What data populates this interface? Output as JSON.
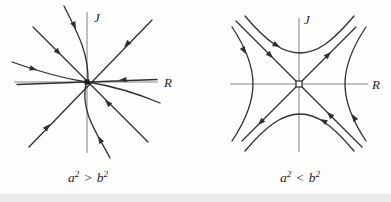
{
  "figure": {
    "panels": [
      {
        "id": "left",
        "axis_labels": {
          "horizontal": "R",
          "vertical": "J"
        },
        "caption": {
          "lhs_base": "a",
          "lhs_exponent": "2",
          "relation": ">",
          "rhs_base": "b",
          "rhs_exponent": "2"
        },
        "origin_marker": "filled-square",
        "portrait_type": "stable-node"
      },
      {
        "id": "right",
        "axis_labels": {
          "horizontal": "R",
          "vertical": "J"
        },
        "caption": {
          "lhs_base": "a",
          "lhs_exponent": "2",
          "relation": "<",
          "rhs_base": "b",
          "rhs_exponent": "2"
        },
        "origin_marker": "open-square",
        "portrait_type": "saddle"
      }
    ],
    "colors": {
      "ink": "#2f2f2f",
      "axis": "#8c8c8c",
      "background": "#fdfdfc",
      "scan_shadow": "#e2e2e2"
    }
  }
}
